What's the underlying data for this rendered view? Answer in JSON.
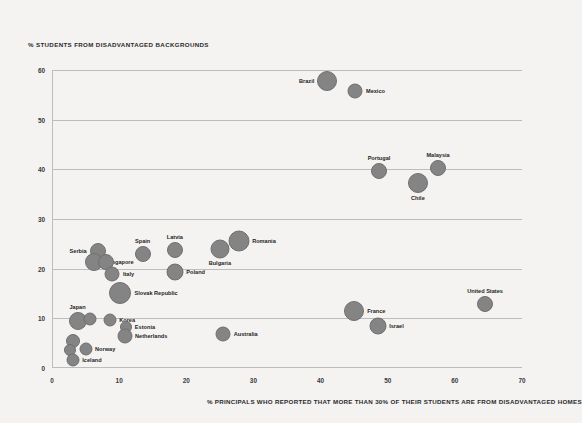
{
  "chart_data": {
    "type": "scatter",
    "title": "",
    "ylabel": "% STUDENTS FROM DISADVANTAGED BACKGROUNDS",
    "xlabel": "% PRINCIPALS WHO REPORTED THAT MORE THAN 30% OF THEIR STUDENTS ARE FROM DISADVANTAGED HOMES",
    "xlim": [
      0,
      70
    ],
    "ylim": [
      0,
      60
    ],
    "xticks": [
      "0",
      "10",
      "20",
      "30",
      "40",
      "50",
      "60",
      "70"
    ],
    "xtick_values": [
      0,
      10,
      20,
      30,
      40,
      50,
      60,
      70
    ],
    "yticks": [
      "0",
      "10",
      "20",
      "30",
      "40",
      "50",
      "60"
    ],
    "ytick_values": [
      0,
      10,
      20,
      30,
      40,
      50,
      60
    ],
    "grid": "horizontal",
    "legend": "none",
    "bubble_color": "#848484",
    "background": "#f4f3f1",
    "points": [
      {
        "label": "Brazil",
        "x": 41.0,
        "y": 57.8,
        "r": 10.0,
        "label_side": "left"
      },
      {
        "label": "Mexico",
        "x": 45.2,
        "y": 55.8,
        "r": 7.5,
        "label_side": "right"
      },
      {
        "label": "Malaysia",
        "x": 57.5,
        "y": 40.3,
        "r": 8.0,
        "label_side": "above"
      },
      {
        "label": "Portugal",
        "x": 48.7,
        "y": 39.7,
        "r": 8.0,
        "label_side": "above"
      },
      {
        "label": "Chile",
        "x": 54.5,
        "y": 37.3,
        "r": 10.0,
        "label_side": "below"
      },
      {
        "label": "Romania",
        "x": 27.8,
        "y": 25.5,
        "r": 10.5,
        "label_side": "right"
      },
      {
        "label": "Bulgaria",
        "x": 25.0,
        "y": 24.0,
        "r": 9.5,
        "label_side": "below"
      },
      {
        "label": "Latvia",
        "x": 18.3,
        "y": 23.8,
        "r": 8.0,
        "label_side": "above"
      },
      {
        "label": "Spain",
        "x": 13.5,
        "y": 23.0,
        "r": 8.0,
        "label_side": "above"
      },
      {
        "label": "Serbia",
        "x": 6.8,
        "y": 23.5,
        "r": 8.0,
        "label_side": "left"
      },
      {
        "label": "Singapore",
        "x": 6.3,
        "y": 21.4,
        "r": 9.0,
        "label_side": "right"
      },
      {
        "label": "",
        "x": 8.0,
        "y": 21.3,
        "r": 8.0,
        "label_side": "none"
      },
      {
        "label": "Poland",
        "x": 18.3,
        "y": 19.3,
        "r": 8.5,
        "label_side": "right"
      },
      {
        "label": "Italy",
        "x": 9.0,
        "y": 19.0,
        "r": 7.5,
        "label_side": "right"
      },
      {
        "label": "Slovak Republic",
        "x": 10.2,
        "y": 15.2,
        "r": 11.0,
        "label_side": "right"
      },
      {
        "label": "France",
        "x": 45.0,
        "y": 11.5,
        "r": 10.0,
        "label_side": "right"
      },
      {
        "label": "United States",
        "x": 64.5,
        "y": 12.8,
        "r": 8.0,
        "label_side": "above"
      },
      {
        "label": "Japan",
        "x": 3.8,
        "y": 9.5,
        "r": 9.0,
        "label_side": "above"
      },
      {
        "label": "",
        "x": 5.7,
        "y": 9.8,
        "r": 6.5,
        "label_side": "none"
      },
      {
        "label": "Korea",
        "x": 8.6,
        "y": 9.7,
        "r": 6.5,
        "label_side": "right"
      },
      {
        "label": "Israel",
        "x": 48.5,
        "y": 8.5,
        "r": 8.5,
        "label_side": "right"
      },
      {
        "label": "Estonia",
        "x": 11.0,
        "y": 8.2,
        "r": 6.0,
        "label_side": "right"
      },
      {
        "label": "Netherlands",
        "x": 10.8,
        "y": 6.5,
        "r": 7.5,
        "label_side": "right"
      },
      {
        "label": "Australia",
        "x": 25.5,
        "y": 6.8,
        "r": 7.5,
        "label_side": "right"
      },
      {
        "label": "",
        "x": 3.2,
        "y": 5.4,
        "r": 7.0,
        "label_side": "none"
      },
      {
        "label": "Norway",
        "x": 5.0,
        "y": 3.9,
        "r": 6.5,
        "label_side": "right"
      },
      {
        "label": "",
        "x": 2.7,
        "y": 3.6,
        "r": 6.0,
        "label_side": "none"
      },
      {
        "label": "Iceland",
        "x": 3.1,
        "y": 1.7,
        "r": 6.5,
        "label_side": "right"
      }
    ]
  }
}
